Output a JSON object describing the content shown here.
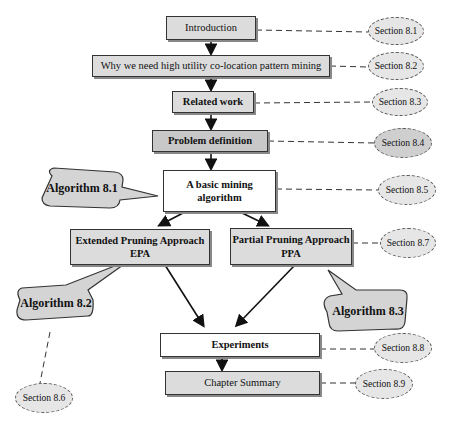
{
  "diagram": {
    "nodes": [
      {
        "id": "intro",
        "label": "Introduction",
        "section": "Section 8.1"
      },
      {
        "id": "why",
        "label": "Why we need high utility co-location pattern mining",
        "section": "Section 8.2"
      },
      {
        "id": "related",
        "label": "Related work",
        "section": "Section 8.3"
      },
      {
        "id": "problem",
        "label": "Problem definition",
        "section": "Section 8.4"
      },
      {
        "id": "basic",
        "label": "A basic mining algorithm",
        "section": "Section 8.5"
      },
      {
        "id": "epa",
        "label": "Extended Pruning Approach",
        "label2": "EPA",
        "section": "Section 8.6"
      },
      {
        "id": "ppa",
        "label": "Partial Pruning Approach",
        "label2": "PPA",
        "section": "Section 8.7"
      },
      {
        "id": "exp",
        "label": "Experiments",
        "section": "Section 8.8"
      },
      {
        "id": "summary",
        "label": "Chapter Summary",
        "section": "Section 8.9"
      }
    ],
    "callouts": [
      {
        "label": "Algorithm 8.1",
        "target": "basic"
      },
      {
        "label": "Algorithm 8.2",
        "target": "epa"
      },
      {
        "label": "Algorithm 8.3",
        "target": "ppa"
      }
    ],
    "labels": {
      "basic_line1": "A basic mining",
      "basic_line2": "algorithm"
    }
  }
}
